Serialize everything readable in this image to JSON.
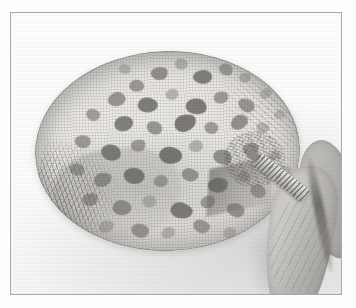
{
  "image": {
    "kind": "photograph",
    "subject": "oval spotted textile specimen held at one edge by a hand",
    "color_mode": "grayscale",
    "alt": "Black and white photograph of a flat oval piece of spotted woven cloth lying on a white surface; a hand at the right holds a small ridged tool against its edge.",
    "caption": "",
    "frame": {
      "border_color": "#a9a9a9",
      "background_color": "#ffffff",
      "left": 10,
      "top": 12,
      "width": 332,
      "height": 283
    },
    "palette": {
      "page_background": "#ffffff",
      "photo_background": "#fdfdfd",
      "specimen_light": "#f2f1ef",
      "specimen_mid": "#e2e0dc",
      "specimen_shadow": "#d6d4cf",
      "spot_dark": "#6a6865",
      "spot_mid": "#7c7a77",
      "spot_light": "#979591",
      "skin_light": "#dedcd8",
      "skin_mid": "#b7b5b1",
      "skin_dark": "#8d8b87",
      "tool_light": "#e9e7e3",
      "tool_dark": "#8e8c88"
    },
    "regions": [
      {
        "name": "specimen",
        "label": "oval spotted cloth",
        "left": 24,
        "top": 38,
        "width": 265,
        "height": 200,
        "rotation": -1.5
      },
      {
        "name": "fringe",
        "label": "frayed fibre edge",
        "left": 18,
        "top": 134,
        "width": 120,
        "height": 128
      },
      {
        "name": "hand",
        "label": "hand holding specimen",
        "left": 252,
        "top": 130,
        "width": 104,
        "height": 168
      },
      {
        "name": "tool",
        "label": "small ridged tool",
        "left": 246,
        "top": 138,
        "width": 62,
        "height": 15,
        "rotation": 38
      }
    ],
    "spots": [
      {
        "x": 118,
        "y": 16,
        "w": 17,
        "h": 13,
        "r": -12,
        "t": 0.78
      },
      {
        "x": 142,
        "y": 8,
        "w": 13,
        "h": 11,
        "r": 18,
        "t": 0.62
      },
      {
        "x": 160,
        "y": 20,
        "w": 19,
        "h": 14,
        "r": -6,
        "t": 0.8
      },
      {
        "x": 186,
        "y": 14,
        "w": 14,
        "h": 12,
        "r": 26,
        "t": 0.66
      },
      {
        "x": 206,
        "y": 24,
        "w": 12,
        "h": 10,
        "r": -20,
        "t": 0.58
      },
      {
        "x": 96,
        "y": 28,
        "w": 15,
        "h": 12,
        "r": 10,
        "t": 0.7
      },
      {
        "x": 74,
        "y": 40,
        "w": 18,
        "h": 14,
        "r": -16,
        "t": 0.74
      },
      {
        "x": 104,
        "y": 46,
        "w": 20,
        "h": 15,
        "r": 8,
        "t": 0.82
      },
      {
        "x": 132,
        "y": 38,
        "w": 13,
        "h": 11,
        "r": -24,
        "t": 0.6
      },
      {
        "x": 152,
        "y": 48,
        "w": 21,
        "h": 16,
        "r": 14,
        "t": 0.84
      },
      {
        "x": 180,
        "y": 42,
        "w": 15,
        "h": 12,
        "r": -10,
        "t": 0.68
      },
      {
        "x": 204,
        "y": 50,
        "w": 17,
        "h": 13,
        "r": 22,
        "t": 0.72
      },
      {
        "x": 226,
        "y": 40,
        "w": 12,
        "h": 10,
        "r": -18,
        "t": 0.54
      },
      {
        "x": 52,
        "y": 56,
        "w": 14,
        "h": 12,
        "r": 12,
        "t": 0.64
      },
      {
        "x": 80,
        "y": 64,
        "w": 19,
        "h": 15,
        "r": -8,
        "t": 0.8
      },
      {
        "x": 112,
        "y": 70,
        "w": 16,
        "h": 13,
        "r": 20,
        "t": 0.72
      },
      {
        "x": 140,
        "y": 64,
        "w": 22,
        "h": 17,
        "r": -14,
        "t": 0.86
      },
      {
        "x": 170,
        "y": 72,
        "w": 14,
        "h": 12,
        "r": 6,
        "t": 0.66
      },
      {
        "x": 196,
        "y": 66,
        "w": 18,
        "h": 14,
        "r": -22,
        "t": 0.76
      },
      {
        "x": 222,
        "y": 74,
        "w": 13,
        "h": 11,
        "r": 16,
        "t": 0.58
      },
      {
        "x": 40,
        "y": 82,
        "w": 16,
        "h": 13,
        "r": -6,
        "t": 0.7
      },
      {
        "x": 66,
        "y": 92,
        "w": 20,
        "h": 16,
        "r": 18,
        "t": 0.82
      },
      {
        "x": 96,
        "y": 88,
        "w": 15,
        "h": 12,
        "r": -16,
        "t": 0.68
      },
      {
        "x": 124,
        "y": 96,
        "w": 23,
        "h": 17,
        "r": 10,
        "t": 0.88
      },
      {
        "x": 154,
        "y": 90,
        "w": 14,
        "h": 12,
        "r": -20,
        "t": 0.62
      },
      {
        "x": 178,
        "y": 100,
        "w": 19,
        "h": 15,
        "r": 24,
        "t": 0.78
      },
      {
        "x": 208,
        "y": 94,
        "w": 16,
        "h": 13,
        "r": -10,
        "t": 0.7
      },
      {
        "x": 234,
        "y": 102,
        "w": 12,
        "h": 10,
        "r": 14,
        "t": 0.52
      },
      {
        "x": 34,
        "y": 110,
        "w": 15,
        "h": 12,
        "r": 20,
        "t": 0.66
      },
      {
        "x": 58,
        "y": 120,
        "w": 18,
        "h": 14,
        "r": -12,
        "t": 0.76
      },
      {
        "x": 88,
        "y": 116,
        "w": 21,
        "h": 16,
        "r": 8,
        "t": 0.84
      },
      {
        "x": 118,
        "y": 124,
        "w": 14,
        "h": 12,
        "r": -24,
        "t": 0.64
      },
      {
        "x": 146,
        "y": 118,
        "w": 17,
        "h": 13,
        "r": 16,
        "t": 0.74
      },
      {
        "x": 172,
        "y": 128,
        "w": 20,
        "h": 15,
        "r": -8,
        "t": 0.8
      },
      {
        "x": 202,
        "y": 122,
        "w": 13,
        "h": 11,
        "r": 22,
        "t": 0.58
      },
      {
        "x": 46,
        "y": 140,
        "w": 16,
        "h": 13,
        "r": -18,
        "t": 0.7
      },
      {
        "x": 76,
        "y": 148,
        "w": 19,
        "h": 15,
        "r": 10,
        "t": 0.78
      },
      {
        "x": 106,
        "y": 144,
        "w": 14,
        "h": 12,
        "r": -6,
        "t": 0.62
      },
      {
        "x": 134,
        "y": 152,
        "w": 22,
        "h": 16,
        "r": 18,
        "t": 0.84
      },
      {
        "x": 164,
        "y": 146,
        "w": 15,
        "h": 12,
        "r": -20,
        "t": 0.66
      },
      {
        "x": 190,
        "y": 154,
        "w": 18,
        "h": 14,
        "r": 12,
        "t": 0.74
      },
      {
        "x": 62,
        "y": 168,
        "w": 15,
        "h": 12,
        "r": -14,
        "t": 0.6
      },
      {
        "x": 94,
        "y": 172,
        "w": 18,
        "h": 14,
        "r": 8,
        "t": 0.72
      },
      {
        "x": 124,
        "y": 176,
        "w": 14,
        "h": 11,
        "r": -22,
        "t": 0.58
      },
      {
        "x": 156,
        "y": 170,
        "w": 17,
        "h": 13,
        "r": 16,
        "t": 0.68
      },
      {
        "x": 186,
        "y": 178,
        "w": 13,
        "h": 11,
        "r": -10,
        "t": 0.54
      },
      {
        "x": 214,
        "y": 136,
        "w": 16,
        "h": 13,
        "r": 20,
        "t": 0.66
      },
      {
        "x": 240,
        "y": 62,
        "w": 11,
        "h": 9,
        "r": -16,
        "t": 0.48
      },
      {
        "x": 244,
        "y": 118,
        "w": 12,
        "h": 10,
        "r": 10,
        "t": 0.5
      },
      {
        "x": 86,
        "y": 12,
        "w": 12,
        "h": 10,
        "r": 24,
        "t": 0.54
      }
    ]
  }
}
